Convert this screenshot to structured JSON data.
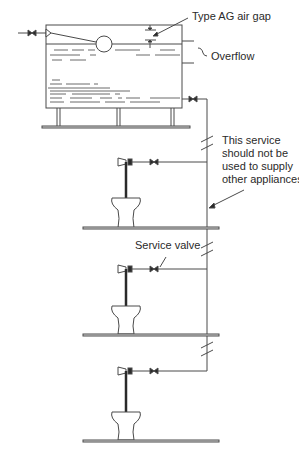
{
  "diagram": {
    "labels": {
      "air_gap": "Type AG air gap",
      "overflow": "Overflow",
      "service_note_1": "This service",
      "service_note_2": "should not be",
      "service_note_3": "used to supply",
      "service_note_4": "other appliances",
      "service_valve": "Service valve"
    },
    "components": {
      "cistern": "storage-cistern",
      "float_valve": "float-operated-valve",
      "inlet_valve": "inlet-stop-valve",
      "outlet_valve": "outlet-stop-valve",
      "riser": "distribution-pipe",
      "floors": 3,
      "wcs": 3,
      "service_valves": 3
    },
    "colors": {
      "line": "#4a4a4a",
      "text": "#2a2a2a",
      "background": "#ffffff"
    }
  }
}
